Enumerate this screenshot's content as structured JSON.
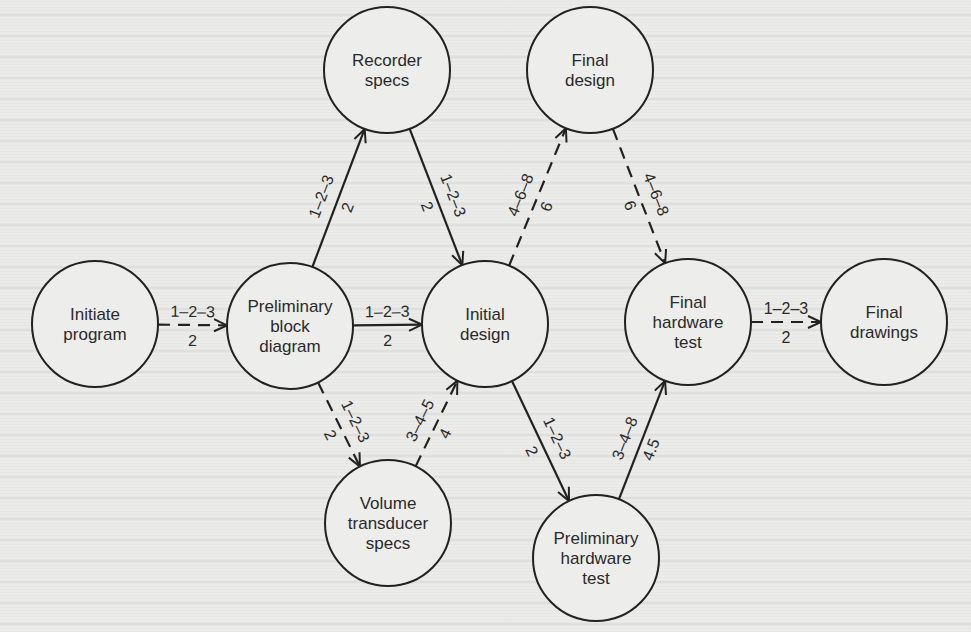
{
  "diagram": {
    "type": "PERT network",
    "colors": {
      "stroke": "#222222",
      "text": "#2a2a2a",
      "background": "#ebebe9"
    },
    "nodes": [
      {
        "id": "initiate",
        "lines": [
          "Initiate",
          "program"
        ],
        "cx": 95,
        "cy": 324,
        "r": 63
      },
      {
        "id": "prelim_block",
        "lines": [
          "Preliminary",
          "block",
          "diagram"
        ],
        "cx": 290,
        "cy": 326,
        "r": 63
      },
      {
        "id": "recorder",
        "lines": [
          "Recorder",
          "specs"
        ],
        "cx": 387,
        "cy": 70,
        "r": 63
      },
      {
        "id": "initial_design",
        "lines": [
          "Initial",
          "design"
        ],
        "cx": 485,
        "cy": 324,
        "r": 63
      },
      {
        "id": "final_design",
        "lines": [
          "Final",
          "design"
        ],
        "cx": 590,
        "cy": 70,
        "r": 63
      },
      {
        "id": "volume",
        "lines": [
          "Volume",
          "transducer",
          "specs"
        ],
        "cx": 388,
        "cy": 523,
        "r": 63
      },
      {
        "id": "prelim_hw",
        "lines": [
          "Preliminary",
          "hardware",
          "test"
        ],
        "cx": 596,
        "cy": 558,
        "r": 63
      },
      {
        "id": "final_hw",
        "lines": [
          "Final",
          "hardware",
          "test"
        ],
        "cx": 688,
        "cy": 322,
        "r": 63
      },
      {
        "id": "final_drawings",
        "lines": [
          "Final",
          "drawings"
        ],
        "cx": 884,
        "cy": 322,
        "r": 63
      }
    ],
    "edges": [
      {
        "from": "initiate",
        "to": "prelim_block",
        "style": "dashed",
        "estimates": "1–2–3",
        "expected": "2"
      },
      {
        "from": "prelim_block",
        "to": "recorder",
        "style": "solid",
        "estimates": "1–2–3",
        "expected": "2"
      },
      {
        "from": "prelim_block",
        "to": "initial_design",
        "style": "solid",
        "estimates": "1–2–3",
        "expected": "2"
      },
      {
        "from": "prelim_block",
        "to": "volume",
        "style": "dashed",
        "estimates": "1–2–3",
        "expected": "2"
      },
      {
        "from": "recorder",
        "to": "initial_design",
        "style": "solid",
        "estimates": "1–2–3",
        "expected": "2"
      },
      {
        "from": "volume",
        "to": "initial_design",
        "style": "dashed",
        "estimates": "3–4–5",
        "expected": "4"
      },
      {
        "from": "initial_design",
        "to": "final_design",
        "style": "dashed",
        "estimates": "4–6–8",
        "expected": "6"
      },
      {
        "from": "initial_design",
        "to": "prelim_hw",
        "style": "solid",
        "estimates": "1–2–3",
        "expected": "2"
      },
      {
        "from": "final_design",
        "to": "final_hw",
        "style": "dashed",
        "estimates": "4–6–8",
        "expected": "6"
      },
      {
        "from": "prelim_hw",
        "to": "final_hw",
        "style": "solid",
        "estimates": "3–4–8",
        "expected": "4.5"
      },
      {
        "from": "final_hw",
        "to": "final_drawings",
        "style": "dashed",
        "estimates": "1–2–3",
        "expected": "2"
      }
    ]
  }
}
